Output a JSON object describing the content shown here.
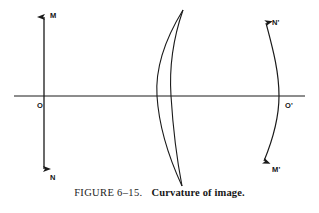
{
  "figure": {
    "caption_number": "FIGURE 6–15.",
    "caption_title": "Curvature of image.",
    "background_color": "#ffffff",
    "stroke_color": "#1a1a1a"
  },
  "diagram": {
    "axis": {
      "name": "optical-axis",
      "orientation": "horizontal",
      "x_start": 14,
      "x_end": 305,
      "y": 96
    },
    "object_arrow": {
      "name": "object-MN",
      "orientation": "vertical",
      "x": 44,
      "y_top": 12,
      "y_bottom": 174,
      "double_headed": true
    },
    "labels": [
      {
        "id": "M",
        "text": "M",
        "x": 50,
        "y": 18
      },
      {
        "id": "N",
        "text": "N",
        "x": 50,
        "y": 180
      },
      {
        "id": "O",
        "text": "O",
        "x": 37,
        "y": 108
      },
      {
        "id": "N-prime",
        "text": "N'",
        "x": 272,
        "y": 25
      },
      {
        "id": "M-prime",
        "text": "M'",
        "x": 272,
        "y": 172
      },
      {
        "id": "O-prime",
        "text": "O'",
        "x": 285,
        "y": 108
      }
    ],
    "lens": {
      "name": "meniscus-lens",
      "front_surface_axis_x": 157,
      "back_surface_axis_x": 171,
      "top_y": 10,
      "bottom_y": 186
    },
    "image_arc": {
      "name": "curved-image-surface",
      "axis_crossing_x": 279,
      "top_tip_x": 264,
      "top_tip_y": 20,
      "bottom_tip_x": 262,
      "bottom_tip_y": 164,
      "double_headed": true
    }
  }
}
